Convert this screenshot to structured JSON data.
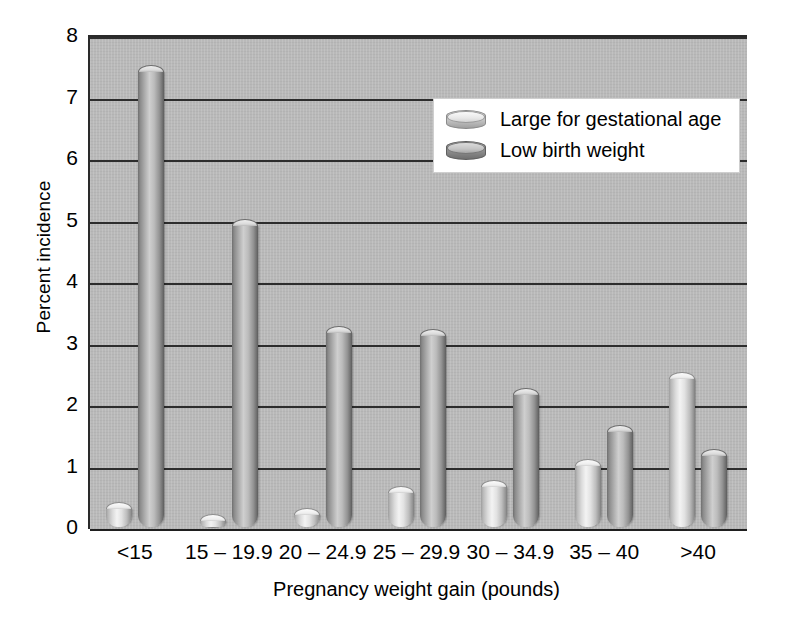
{
  "chart_data": {
    "type": "bar",
    "title": "",
    "xlabel": "Pregnancy weight gain (pounds)",
    "ylabel": "Percent incidence",
    "categories": [
      "<15",
      "15 – 19.9",
      "20 – 24.9",
      "25 – 29.9",
      "30 – 34.9",
      "35 – 40",
      ">40"
    ],
    "series": [
      {
        "name": "Large for gestational age",
        "color": "#e0e0e0",
        "values": [
          0.3,
          0.1,
          0.2,
          0.55,
          0.65,
          1.0,
          2.4
        ]
      },
      {
        "name": "Low birth weight",
        "color": "#9a9a9a",
        "values": [
          7.4,
          4.9,
          3.15,
          3.1,
          2.15,
          1.55,
          1.15
        ]
      }
    ],
    "ylim": [
      0,
      8
    ],
    "yticks": [
      "0",
      "1",
      "2",
      "3",
      "4",
      "5",
      "6",
      "7",
      "8"
    ],
    "ytick_values": [
      0,
      1,
      2,
      3,
      4,
      5,
      6,
      7,
      8
    ],
    "grid": true,
    "legend_position": "top-right",
    "plot_background": "#b9b9b9",
    "figure_background": "#ffffff"
  },
  "legend": {
    "entries": [
      {
        "label": "Large for gestational age",
        "swatch": "cylinder-light-icon"
      },
      {
        "label": "Low birth weight",
        "swatch": "cylinder-dark-icon"
      }
    ]
  }
}
